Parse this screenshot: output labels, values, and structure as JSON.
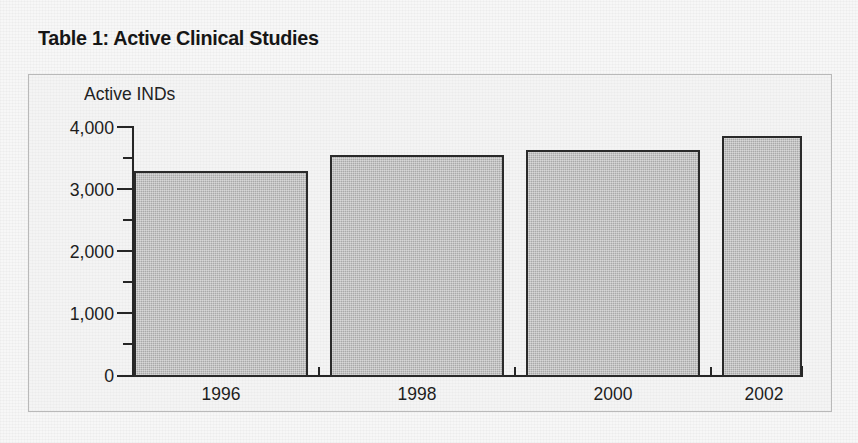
{
  "figure": {
    "title": "Table 1: Active Clinical Studies"
  },
  "colors": {
    "bar_fill": "#a9a9a9",
    "bar_border": "#2a2a2a",
    "axis": "#262626",
    "frame_border": "#b9b9b9",
    "plot_background": "#f4f4f4",
    "page_background": "#f7f7f7",
    "text": "#1d1d1d"
  },
  "chart_data": {
    "type": "bar",
    "title": "Table 1: Active Clinical Studies",
    "xlabel": "",
    "ylabel": "Active INDs",
    "categories": [
      "1996",
      "1998",
      "2000",
      "2002"
    ],
    "values": [
      3330,
      3580,
      3660,
      3890
    ],
    "ylim": [
      0,
      4000
    ],
    "ytick_labels": [
      "0",
      "1,000",
      "2,000",
      "3,000",
      "4,000"
    ],
    "ytick_values": [
      0,
      1000,
      2000,
      3000,
      4000
    ],
    "yminor_tick_values": [
      500,
      1500,
      2500,
      3500
    ],
    "grid": false,
    "legend": false,
    "legend_position": "none",
    "series": [
      {
        "name": "Active INDs",
        "values": [
          3330,
          3580,
          3660,
          3890
        ]
      }
    ]
  }
}
